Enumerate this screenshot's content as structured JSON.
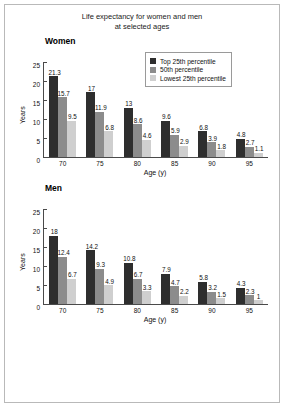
{
  "figure": {
    "title_line1": "Life expectancy for women and men",
    "title_line2": "at selected ages",
    "legend": {
      "items": [
        {
          "label": "Top 25th percentile",
          "color": "#2e2e2e"
        },
        {
          "label": "50th percentile",
          "color": "#8c8c8c"
        },
        {
          "label": "Lowest 25th percentile",
          "color": "#cfcfcf"
        }
      ]
    }
  },
  "chart_data": [
    {
      "type": "bar",
      "title": "Women",
      "xlabel": "Age (y)",
      "ylabel": "Years",
      "ylim": [
        0,
        25
      ],
      "yticks": [
        0,
        5,
        10,
        15,
        20,
        25
      ],
      "grid": false,
      "legend_position": "top-right",
      "categories": [
        "70",
        "75",
        "80",
        "85",
        "90",
        "95"
      ],
      "series": [
        {
          "name": "Top 25th percentile",
          "color": "#2e2e2e",
          "values": [
            21.3,
            17,
            13,
            9.6,
            6.8,
            4.8
          ],
          "labels": [
            "21.3",
            "17",
            "13",
            "9.6",
            "6.8",
            "4.8"
          ]
        },
        {
          "name": "50th percentile",
          "color": "#8c8c8c",
          "values": [
            15.7,
            11.9,
            8.6,
            5.9,
            3.9,
            2.7
          ],
          "labels": [
            "15.7",
            "11.9",
            "8.6",
            "5.9",
            "3.9",
            "2.7"
          ]
        },
        {
          "name": "Lowest 25th percentile",
          "color": "#cfcfcf",
          "values": [
            9.5,
            6.8,
            4.6,
            2.9,
            1.8,
            1.1
          ],
          "labels": [
            "9.5",
            "6.8",
            "4.6",
            "2.9",
            "1.8",
            "1.1"
          ]
        }
      ]
    },
    {
      "type": "bar",
      "title": "Men",
      "xlabel": "Age (y)",
      "ylabel": "Years",
      "ylim": [
        0,
        25
      ],
      "yticks": [
        0,
        5,
        10,
        15,
        20,
        25
      ],
      "grid": false,
      "legend_position": "none",
      "categories": [
        "70",
        "75",
        "80",
        "85",
        "90",
        "95"
      ],
      "series": [
        {
          "name": "Top 25th percentile",
          "color": "#2e2e2e",
          "values": [
            18,
            14.2,
            10.8,
            7.9,
            5.8,
            4.3
          ],
          "labels": [
            "18",
            "14.2",
            "10.8",
            "7.9",
            "5.8",
            "4.3"
          ]
        },
        {
          "name": "50th percentile",
          "color": "#8c8c8c",
          "values": [
            12.4,
            9.3,
            6.7,
            4.7,
            3.2,
            2.3
          ],
          "labels": [
            "12.4",
            "9.3",
            "6.7",
            "4.7",
            "3.2",
            "2.3"
          ]
        },
        {
          "name": "Lowest 25th percentile",
          "color": "#cfcfcf",
          "values": [
            6.7,
            4.9,
            3.3,
            2.2,
            1.5,
            1.0
          ],
          "labels": [
            "6.7",
            "4.9",
            "3.3",
            "2.2",
            "1.5",
            "1"
          ]
        }
      ]
    }
  ]
}
